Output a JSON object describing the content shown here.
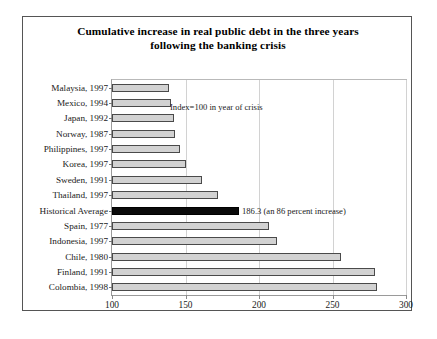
{
  "chart_data": {
    "type": "bar",
    "orientation": "horizontal",
    "title": "Cumulative increase in real public debt in the three years following the banking crisis",
    "title_line1": "Cumulative increase in real public debt in the three years",
    "title_line2": "following the banking crisis",
    "xlabel": "",
    "ylabel": "",
    "xlim": [
      100,
      300
    ],
    "xticks": [
      100,
      150,
      200,
      250,
      300
    ],
    "xtick_labels": [
      "100",
      "150",
      "200",
      "250",
      "300"
    ],
    "grid": true,
    "legend": null,
    "categories": [
      "Malaysia, 1997",
      "Mexico, 1994",
      "Japan, 1992",
      "Norway, 1987",
      "Philippines, 1997",
      "Korea, 1997",
      "Sweden, 1991",
      "Thailand, 1997",
      "Historical Average",
      "Spain, 1977",
      "Indonesia, 1997",
      "Chile, 1980",
      "Finland, 1991",
      "Colombia, 1998"
    ],
    "values": [
      139,
      140,
      142,
      143,
      146,
      150,
      161,
      172,
      186.3,
      207,
      212,
      256,
      279,
      280
    ],
    "highlight_index": 8,
    "highlight_color": "#0a0a0a",
    "bar_color": "#d2d2d2",
    "bar_edge_color": "#4a4a4a",
    "annotations": [
      {
        "id": "index-note",
        "text": "Index=100 in year of crisis"
      },
      {
        "id": "average-note",
        "text": "186.3 (an 86 percent increase)"
      }
    ]
  }
}
